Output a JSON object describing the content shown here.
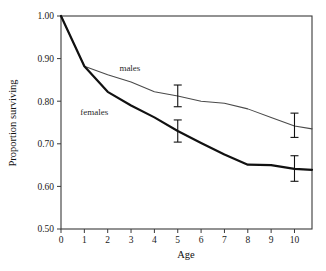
{
  "chart_data": {
    "type": "line",
    "title": "",
    "xlabel": "Age",
    "ylabel": "Proportion surviving",
    "xlim": [
      0,
      10.75
    ],
    "ylim": [
      0.5,
      1.0
    ],
    "grid": false,
    "legend_position": "inline-annotations",
    "x_ticks": [
      "0",
      "1",
      "2",
      "3",
      "4",
      "5",
      "6",
      "7",
      "8",
      "9",
      "10"
    ],
    "x_tick_values": [
      0,
      1,
      2,
      3,
      4,
      5,
      6,
      7,
      8,
      9,
      10
    ],
    "y_ticks": [
      "0.50",
      "0.60",
      "0.70",
      "0.80",
      "0.90",
      "1.00"
    ],
    "y_tick_values": [
      0.5,
      0.6,
      0.7,
      0.8,
      0.9,
      1.0
    ],
    "x": [
      0,
      1,
      2,
      3,
      4,
      5,
      6,
      7,
      8,
      9,
      10,
      10.75
    ],
    "series": [
      {
        "name": "males",
        "label": "males",
        "color": "#4a4a4a",
        "style": "thin",
        "values": [
          1.0,
          0.882,
          0.862,
          0.845,
          0.822,
          0.812,
          0.8,
          0.795,
          0.782,
          0.762,
          0.742,
          0.735
        ],
        "error_bars": [
          {
            "x": 5,
            "y": 0.812,
            "upper": 0.838,
            "lower": 0.787
          },
          {
            "x": 10,
            "y": 0.742,
            "upper": 0.772,
            "lower": 0.715
          }
        ]
      },
      {
        "name": "females",
        "label": "females",
        "color": "#111111",
        "style": "thick",
        "values": [
          1.0,
          0.882,
          0.822,
          0.79,
          0.762,
          0.73,
          0.702,
          0.675,
          0.651,
          0.65,
          0.641,
          0.639
        ],
        "error_bars": [
          {
            "x": 5,
            "y": 0.73,
            "upper": 0.756,
            "lower": 0.704
          },
          {
            "x": 10,
            "y": 0.641,
            "upper": 0.672,
            "lower": 0.612
          }
        ]
      }
    ],
    "annotations": [
      {
        "text": "males",
        "x": 2.95,
        "y": 0.872
      },
      {
        "text": "females",
        "x": 1.42,
        "y": 0.768
      }
    ]
  }
}
